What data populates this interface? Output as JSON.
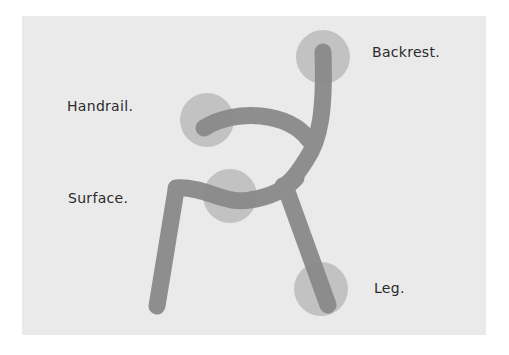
{
  "diagram": {
    "labels": {
      "backrest": "Backrest.",
      "handrail": "Handrail.",
      "surface": "Surface.",
      "leg": "Leg."
    },
    "colors": {
      "panel_background": "#eaeaea",
      "stroke": "#8a8a8a",
      "highlight_circle": "#b4b4b4",
      "label_text": "#2b2b2b"
    },
    "parts": [
      "backrest",
      "handrail",
      "surface",
      "leg"
    ]
  }
}
